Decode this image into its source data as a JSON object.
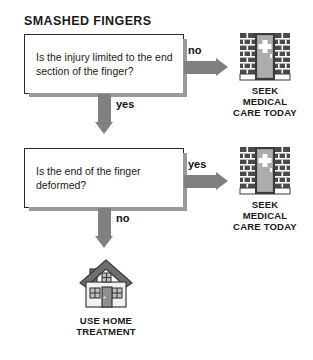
{
  "title": "SMASHED FINGERS",
  "diagram": {
    "type": "flowchart",
    "orientation": "vertical",
    "colors": {
      "arrow": "#808080",
      "box_border": "#2b2b2b",
      "box_fill": "#ffffff",
      "box_shadow": "#9a9a9a",
      "text": "#1a1a1a",
      "brick": "#4a4a4a",
      "door": "#9d9d9d",
      "roof": "#6e6e6e",
      "cross": "#ffffff",
      "background": "#ffffff"
    }
  },
  "nodes": {
    "question_1": {
      "id": "q1",
      "text": "Is the injury limited to the end section of the finger?"
    },
    "question_2": {
      "id": "q2",
      "text": "Is the end of the finger deformed?"
    },
    "outcome_1": {
      "id": "o1",
      "icon": "hospital-building-icon",
      "caption": "SEEK\nMEDICAL\nCARE TODAY"
    },
    "outcome_2": {
      "id": "o2",
      "icon": "hospital-building-icon",
      "caption": "SEEK\nMEDICAL\nCARE TODAY"
    },
    "outcome_3": {
      "id": "o3",
      "icon": "house-icon",
      "caption": "USE HOME\nTREATMENT"
    }
  },
  "edges": [
    {
      "from": "q1",
      "to": "o1",
      "label": "no",
      "direction": "right"
    },
    {
      "from": "q1",
      "to": "q2",
      "label": "yes",
      "direction": "down"
    },
    {
      "from": "q2",
      "to": "o2",
      "label": "yes",
      "direction": "right"
    },
    {
      "from": "q2",
      "to": "o3",
      "label": "no",
      "direction": "down"
    }
  ],
  "labels": {
    "no_1": "no",
    "yes_1": "yes",
    "yes_2": "yes",
    "no_2": "no"
  }
}
